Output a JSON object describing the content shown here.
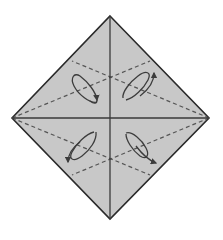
{
  "diagram": {
    "type": "origami-fold-diagram",
    "width": 223,
    "height": 240,
    "colors": {
      "background": "#ffffff",
      "paper_fill": "#c8c8c8",
      "outline": "#2a2a2a",
      "crease": "#3a3a3a",
      "valley_fold": "#555555",
      "arrow": "#3c3c3c"
    },
    "paper": {
      "shape": "square-rotated-45",
      "vertices": {
        "top": [
          110,
          16
        ],
        "right": [
          209,
          118
        ],
        "bottom": [
          110,
          219
        ],
        "left": [
          12,
          118
        ]
      }
    },
    "creases": [
      {
        "name": "vertical-crease",
        "from": [
          110,
          16
        ],
        "to": [
          110,
          219
        ]
      },
      {
        "name": "horizontal-crease",
        "from": [
          12,
          118
        ],
        "to": [
          209,
          118
        ]
      }
    ],
    "valley_folds": [
      {
        "name": "fold-left-to-upper-right",
        "from": [
          12,
          118
        ],
        "to": [
          150,
          61
        ]
      },
      {
        "name": "fold-right-to-upper-left",
        "from": [
          209,
          118
        ],
        "to": [
          72,
          61
        ]
      },
      {
        "name": "fold-left-to-lower-right",
        "from": [
          12,
          118
        ],
        "to": [
          150,
          175
        ]
      },
      {
        "name": "fold-right-to-lower-left",
        "from": [
          209,
          118
        ],
        "to": [
          72,
          175
        ]
      }
    ],
    "arrows": [
      {
        "name": "arrow-upper-left",
        "loop_center": [
          83,
          88
        ],
        "direction": "up"
      },
      {
        "name": "arrow-upper-right",
        "loop_center": [
          138,
          88
        ],
        "direction": "up"
      },
      {
        "name": "arrow-lower-left",
        "loop_center": [
          83,
          150
        ],
        "direction": "down"
      },
      {
        "name": "arrow-lower-right",
        "loop_center": [
          138,
          150
        ],
        "direction": "down"
      }
    ]
  }
}
